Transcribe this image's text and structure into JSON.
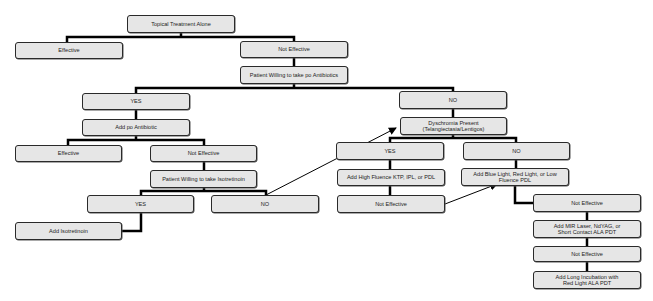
{
  "diagram": {
    "type": "flowchart",
    "topic": "Rosacea treatment algorithm",
    "colors": {
      "node_fill": "#e6e6e6",
      "node_border": "#2a2a2a",
      "connector": "#000000",
      "background": "#ffffff"
    },
    "nodes": {
      "topical": {
        "label": "Topical Treatment Alone"
      },
      "effective_1": {
        "label": "Effective"
      },
      "not_effective_1": {
        "label": "Not Effective"
      },
      "willing_antibiotics": {
        "label": "Patient Willing to take po Antibiotics"
      },
      "yes_antibiotics": {
        "label": "YES"
      },
      "no_antibiotics": {
        "label": "NO"
      },
      "add_antibiotic": {
        "label": "Add po Antibiotic"
      },
      "effective_2": {
        "label": "Effective"
      },
      "not_effective_2": {
        "label": "Not Effective"
      },
      "willing_isotretinoin": {
        "label": "Patient Willing to take Isotretinoin"
      },
      "yes_isotretinoin": {
        "label": "YES"
      },
      "no_isotretinoin": {
        "label": "NO"
      },
      "add_isotretinoin": {
        "label": "Add Isotretinoin"
      },
      "dyschromia": {
        "label": "Dyschromia Present\n(Telangiectasia/Lentigos)"
      },
      "yes_dyschromia": {
        "label": "YES"
      },
      "no_dyschromia": {
        "label": "NO"
      },
      "add_high_fluence": {
        "label": "Add High Fluence KTP, IPL, or PDL"
      },
      "not_effective_3": {
        "label": "Not Effective"
      },
      "add_blue_light": {
        "label": "Add  Blue Light, Red Light, or Low\nFluence PDL"
      },
      "not_effective_4": {
        "label": "Not Effective"
      },
      "add_mir_laser": {
        "label": "Add MIR Laser, NdYAG, or\nShort Contact ALA PDT"
      },
      "not_effective_5": {
        "label": "Not Effective"
      },
      "add_long_incubation": {
        "label": "Add Long Incubation with\nRed Light ALA PDT"
      }
    },
    "edges": [
      [
        "topical",
        "effective_1"
      ],
      [
        "topical",
        "not_effective_1"
      ],
      [
        "not_effective_1",
        "willing_antibiotics"
      ],
      [
        "willing_antibiotics",
        "yes_antibiotics"
      ],
      [
        "willing_antibiotics",
        "no_antibiotics"
      ],
      [
        "yes_antibiotics",
        "add_antibiotic"
      ],
      [
        "add_antibiotic",
        "effective_2"
      ],
      [
        "add_antibiotic",
        "not_effective_2"
      ],
      [
        "not_effective_2",
        "willing_isotretinoin"
      ],
      [
        "willing_isotretinoin",
        "yes_isotretinoin"
      ],
      [
        "willing_isotretinoin",
        "no_isotretinoin"
      ],
      [
        "yes_isotretinoin",
        "add_isotretinoin"
      ],
      [
        "no_isotretinoin",
        "dyschromia",
        "arrow"
      ],
      [
        "no_antibiotics",
        "dyschromia"
      ],
      [
        "dyschromia",
        "yes_dyschromia"
      ],
      [
        "dyschromia",
        "no_dyschromia"
      ],
      [
        "yes_dyschromia",
        "add_high_fluence"
      ],
      [
        "add_high_fluence",
        "not_effective_3"
      ],
      [
        "not_effective_3",
        "add_blue_light",
        "arrow"
      ],
      [
        "no_dyschromia",
        "add_blue_light"
      ],
      [
        "add_blue_light",
        "not_effective_4"
      ],
      [
        "not_effective_4",
        "add_mir_laser"
      ],
      [
        "add_mir_laser",
        "not_effective_5"
      ],
      [
        "not_effective_5",
        "add_long_incubation"
      ]
    ]
  }
}
